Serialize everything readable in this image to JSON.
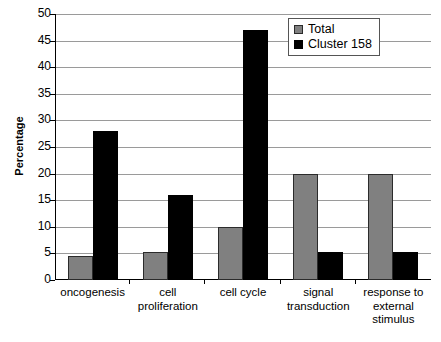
{
  "chart_data": {
    "type": "bar",
    "title": "",
    "xlabel": "",
    "ylabel": "Percentage",
    "ylim": [
      0,
      50
    ],
    "yticks": [
      0,
      5,
      10,
      15,
      20,
      25,
      30,
      35,
      40,
      45,
      50
    ],
    "grid": true,
    "legend_position": "top-right",
    "categories": [
      "oncogenesis",
      "cell proliferation",
      "cell cycle",
      "signal transduction",
      "response to external stimulus"
    ],
    "series": [
      {
        "name": "Total",
        "color": "#808080",
        "values": [
          4.5,
          5.3,
          10,
          20,
          20
        ]
      },
      {
        "name": "Cluster 158",
        "color": "#000000",
        "values": [
          28,
          16,
          47,
          5.2,
          5.2
        ]
      }
    ]
  },
  "axis": {
    "y_title": "Percentage",
    "y_tick_labels": [
      "50",
      "45",
      "40",
      "35",
      "30",
      "25",
      "20",
      "15",
      "10",
      "5",
      "0"
    ]
  },
  "legend": {
    "items": [
      {
        "label": "Total",
        "swatch": "gray-swatch"
      },
      {
        "label": "Cluster 158",
        "swatch": "black-swatch"
      }
    ]
  },
  "x_labels": [
    "oncogenesis",
    "cell proliferation",
    "cell cycle",
    "signal transduction",
    "response to external stimulus"
  ]
}
